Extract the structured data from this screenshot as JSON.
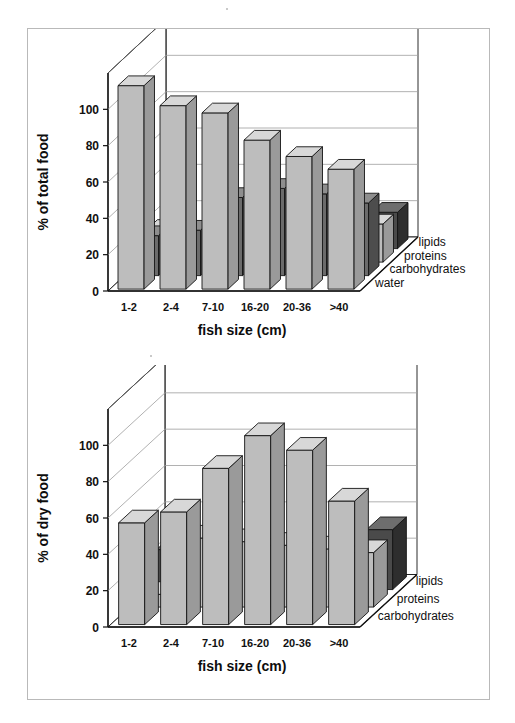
{
  "figure": {
    "background": "#ffffff",
    "border_color": "#b9b9b9"
  },
  "palette": {
    "light_front": "#bdbdbd",
    "light_top": "#d8d8d8",
    "light_side": "#9a9a9a",
    "dark_front": "#6b6b6b",
    "dark_top": "#8e8e8e",
    "dark_side": "#4d4d4d",
    "darkest_front": "#4a4a4a",
    "darkest_top": "#6e6e6e",
    "darkest_side": "#2e2e2e",
    "outline": "#141414",
    "grid": "#9d9d9d",
    "wall": "#5a5a5a"
  },
  "chart_data": [
    {
      "id": "chart-total-food",
      "type": "bar",
      "subtype": "3d-grouped-rows",
      "title": "",
      "xlabel": "fish size (cm)",
      "ylabel": "% of total food",
      "zlabel": "",
      "categories": [
        "1-2",
        "2-4",
        "7-10",
        "16-20",
        "20-36",
        ">40"
      ],
      "yticks": [
        0,
        20,
        40,
        60,
        80,
        100
      ],
      "ylim": [
        0,
        120
      ],
      "grid": true,
      "legend_position": "right-depth-axis",
      "series": [
        {
          "name": "water",
          "shade": "light",
          "values": [
            112,
            101,
            97,
            82,
            73,
            66
          ]
        },
        {
          "name": "carbohydrates",
          "shade": "dark",
          "values": [
            22,
            25,
            43,
            48,
            45,
            40
          ]
        },
        {
          "name": "proteins",
          "shade": "light",
          "values": [
            18,
            17,
            16,
            15,
            17,
            21
          ]
        },
        {
          "name": "lipids",
          "shade": "darkest",
          "values": [
            7,
            7,
            6,
            7,
            13,
            20
          ]
        }
      ]
    },
    {
      "id": "chart-dry-food",
      "type": "bar",
      "subtype": "3d-grouped-rows",
      "title": "",
      "xlabel": "fish size (cm)",
      "ylabel": "% of dry food",
      "zlabel": "",
      "categories": [
        "1-2",
        "2-4",
        "7-10",
        "16-20",
        "20-36",
        ">40"
      ],
      "yticks": [
        0,
        20,
        40,
        60,
        80,
        100
      ],
      "ylim": [
        0,
        120
      ],
      "grid": true,
      "legend_position": "right-depth-axis",
      "series": [
        {
          "name": "carbohydrates",
          "shade": "light",
          "values": [
            56,
            62,
            86,
            104,
            96,
            68
          ]
        },
        {
          "name": "proteins",
          "shade": "light",
          "values": [
            7,
            38,
            36,
            34,
            32,
            30
          ]
        },
        {
          "name": "lipids",
          "shade": "darkest",
          "values": [
            22,
            14,
            12,
            12,
            17,
            33
          ]
        }
      ]
    }
  ],
  "labels": {
    "chart1": {
      "ylabel": "% of total food",
      "xlabel": "fish size (cm)",
      "yticks": [
        "0",
        "20",
        "40",
        "60",
        "80",
        "100"
      ],
      "categories": [
        "1-2",
        "2-4",
        "7-10",
        "16-20",
        "20-36",
        ">40"
      ],
      "series": [
        "water",
        "carbohydrates",
        "proteins",
        "lipids"
      ]
    },
    "chart2": {
      "ylabel": "% of dry food",
      "xlabel": "fish size (cm)",
      "yticks": [
        "0",
        "20",
        "40",
        "60",
        "80",
        "100"
      ],
      "categories": [
        "1-2",
        "2-4",
        "7-10",
        "16-20",
        "20-36",
        ">40"
      ],
      "series": [
        "carbohydrates",
        "proteins",
        "lipids"
      ]
    }
  }
}
